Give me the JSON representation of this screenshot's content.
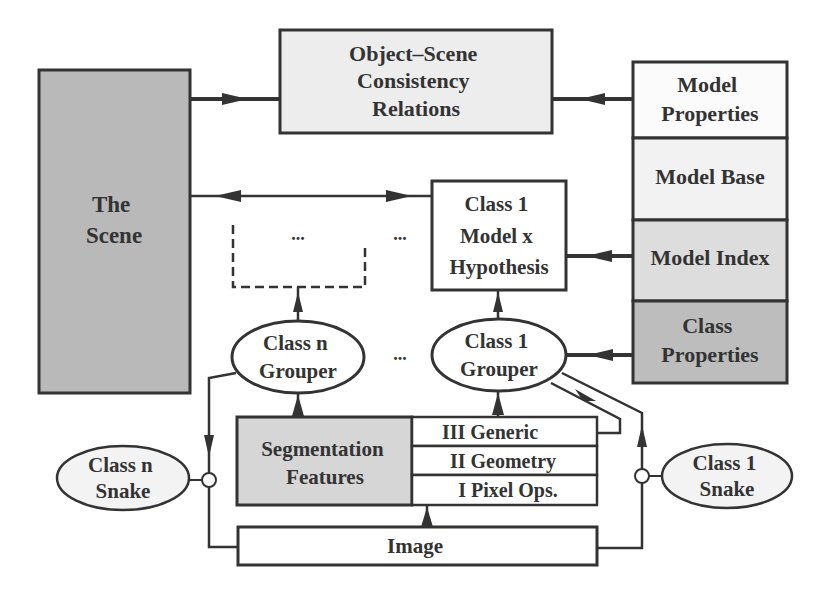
{
  "diagram": {
    "nodes": {
      "scene": {
        "lines": [
          "The",
          "Scene"
        ],
        "fill": "#b9b9b9"
      },
      "consistency": {
        "lines": [
          "Object–Scene",
          "Consistency",
          "Relations"
        ],
        "fill": "#ededed"
      },
      "model_properties": {
        "lines": [
          "Model",
          "Properties"
        ],
        "fill": "#fbfbfb"
      },
      "model_base": {
        "lines": [
          "Model Base"
        ],
        "fill": "#f2f2f2"
      },
      "model_index": {
        "lines": [
          "Model Index"
        ],
        "fill": "#dddddd"
      },
      "class_properties": {
        "lines": [
          "Class",
          "Properties"
        ],
        "fill": "#bdbdbd"
      },
      "hypothesis": {
        "lines": [
          "Class 1",
          "Model x",
          "Hypothesis"
        ],
        "fill": "#ffffff"
      },
      "dashed_placeholder": {
        "lines": [
          "..."
        ]
      },
      "between_dots": {
        "lines": [
          "..."
        ]
      },
      "grouper_dots": {
        "lines": [
          "..."
        ]
      },
      "class_n_grouper": {
        "lines": [
          "Class n",
          "Grouper"
        ],
        "fill": "#ffffff"
      },
      "class_1_grouper": {
        "lines": [
          "Class 1",
          "Grouper"
        ],
        "fill": "#ffffff"
      },
      "segmentation": {
        "lines": [
          "Segmentation",
          "Features"
        ],
        "fill": "#d6d6d6"
      },
      "level_3": {
        "lines": [
          "III Generic"
        ],
        "fill": "#ffffff"
      },
      "level_2": {
        "lines": [
          "II Geometry"
        ],
        "fill": "#ffffff"
      },
      "level_1": {
        "lines": [
          "I Pixel Ops."
        ],
        "fill": "#ffffff"
      },
      "image": {
        "lines": [
          "Image"
        ],
        "fill": "#ffffff"
      },
      "class_n_snake": {
        "lines": [
          "Class n",
          "Snake"
        ],
        "fill": "#f3f3f3"
      },
      "class_1_snake": {
        "lines": [
          "Class 1",
          "Snake"
        ],
        "fill": "#f3f3f3"
      }
    },
    "edges": [
      {
        "from": "scene",
        "to": "consistency"
      },
      {
        "from": "model_properties",
        "to": "consistency"
      },
      {
        "from": "scene",
        "to": "hypothesis",
        "bidirectional": true
      },
      {
        "from": "model_index",
        "to": "hypothesis"
      },
      {
        "from": "class_properties",
        "to": "class_1_grouper"
      },
      {
        "from": "class_1_grouper",
        "to": "hypothesis"
      },
      {
        "from": "class_n_grouper",
        "to": "dashed_placeholder"
      },
      {
        "from": "segmentation",
        "to": "class_n_grouper"
      },
      {
        "from": "level_3",
        "to": "class_1_grouper"
      },
      {
        "from": "class_1_grouper",
        "to": "level_3"
      },
      {
        "from": "image",
        "to": "level_1"
      },
      {
        "from": "class_n_grouper",
        "to": "image",
        "via": "class_n_snake"
      },
      {
        "from": "image",
        "to": "class_1_grouper",
        "via": "class_1_snake"
      }
    ],
    "colors": {
      "stroke": "#333333",
      "text": "#333333",
      "background": "#ffffff"
    }
  }
}
